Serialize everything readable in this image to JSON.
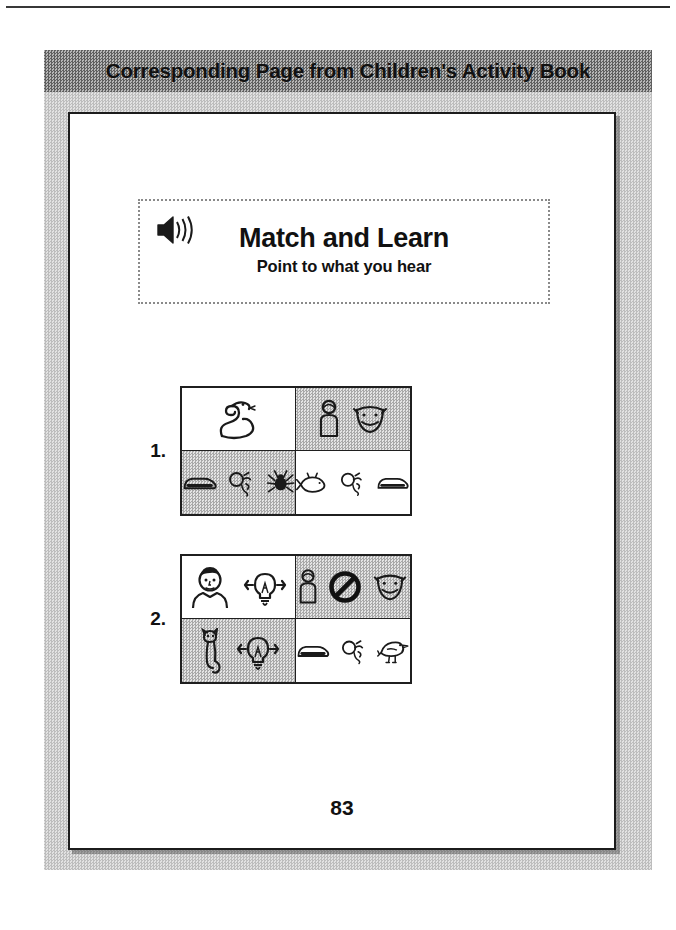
{
  "page": {
    "header_title": "Corresponding Page from Children's Activity Book",
    "page_number": "83"
  },
  "title_box": {
    "speaker_icon": "speaker-sound-icon",
    "title": "Match and Learn",
    "subtitle": "Point to what you hear"
  },
  "exercises": [
    {
      "number": "1.",
      "cells": [
        {
          "shade": "plain",
          "pictograms": [
            "snake"
          ]
        },
        {
          "shade": "shaded",
          "pictograms": [
            "person",
            "smiling-face"
          ]
        },
        {
          "shade": "shaded",
          "pictograms": [
            "shoe",
            "balloon",
            "spider"
          ]
        },
        {
          "shade": "plain",
          "pictograms": [
            "fish",
            "balloon",
            "shoe"
          ]
        }
      ]
    },
    {
      "number": "2.",
      "cells": [
        {
          "shade": "plain",
          "pictograms": [
            "man-head",
            "lightbulb"
          ]
        },
        {
          "shade": "shaded",
          "pictograms": [
            "person",
            "prohibition",
            "smiling-face"
          ]
        },
        {
          "shade": "shaded",
          "pictograms": [
            "cat",
            "lightbulb"
          ]
        },
        {
          "shade": "plain",
          "pictograms": [
            "shoe",
            "balloon",
            "bird"
          ]
        }
      ]
    }
  ],
  "colors": {
    "ink": "#111111",
    "panel_gray": "#c9c9c9",
    "header_gray": "#8d8d8d",
    "cell_shade": "#c4c4c4"
  }
}
